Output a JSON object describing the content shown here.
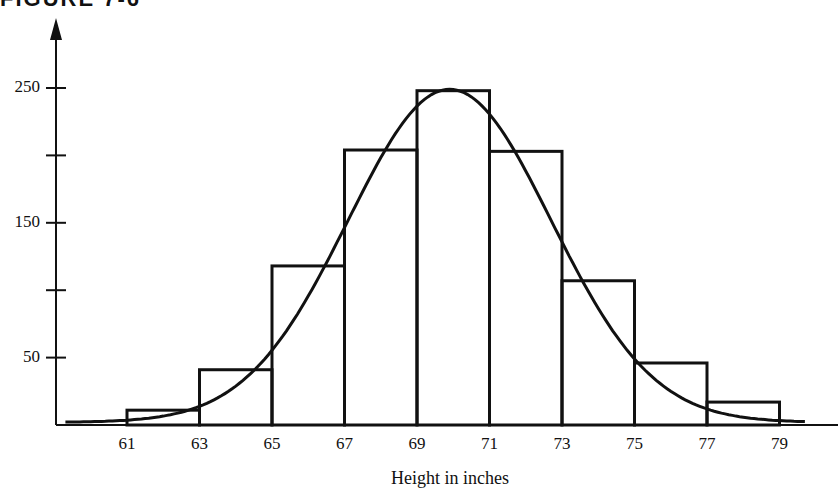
{
  "figure": {
    "title_fragment": "FIGURE 7-6"
  },
  "chart_data": {
    "type": "bar",
    "subtype": "histogram with fitted normal curve",
    "title": "",
    "xlabel": "Height in inches",
    "ylabel": "",
    "x_tick_labels": [
      "61",
      "63",
      "65",
      "67",
      "69",
      "71",
      "73",
      "75",
      "77",
      "79"
    ],
    "y_tick_labels": [
      "50",
      "150",
      "250"
    ],
    "y_ticks": [
      50,
      100,
      150,
      200,
      250
    ],
    "bins": [
      {
        "from": 61,
        "to": 63,
        "value": 11
      },
      {
        "from": 63,
        "to": 65,
        "value": 41
      },
      {
        "from": 65,
        "to": 67,
        "value": 118
      },
      {
        "from": 67,
        "to": 69,
        "value": 204
      },
      {
        "from": 69,
        "to": 71,
        "value": 248
      },
      {
        "from": 71,
        "to": 73,
        "value": 203
      },
      {
        "from": 73,
        "to": 75,
        "value": 107
      },
      {
        "from": 75,
        "to": 77,
        "value": 46
      },
      {
        "from": 77,
        "to": 79,
        "value": 17
      }
    ],
    "categories": [
      "61-63",
      "63-65",
      "65-67",
      "67-69",
      "69-71",
      "71-73",
      "73-75",
      "75-77",
      "77-79"
    ],
    "values": [
      11,
      41,
      118,
      204,
      248,
      203,
      107,
      46,
      17
    ],
    "curve": {
      "type": "normal",
      "mean": 69.9,
      "peak": 247,
      "sd": 2.8,
      "x_start": 59.3,
      "x_end": 79.7
    },
    "xlim": [
      57.3,
      80.7
    ],
    "ylim": [
      0,
      270
    ],
    "grid": false,
    "legend": null
  }
}
